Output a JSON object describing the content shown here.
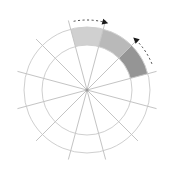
{
  "diagram": {
    "type": "polar-sector-grid",
    "center": {
      "x": 87,
      "y": 90
    },
    "inner_radius": 45,
    "outer_radius": 63,
    "spoke_radius": 72,
    "spoke_count": 12,
    "spoke_offset_deg": 15,
    "colors": {
      "ring": "#cfcfcf",
      "spoke": "#c4c4c4",
      "arrow": "#444444",
      "arrow_head": "#1a1a1a",
      "hub": "#9a9a9a"
    },
    "sectors": [
      {
        "name": "light-sector",
        "start_deg": 75,
        "end_deg": 105,
        "color": "#d0d0d0"
      },
      {
        "name": "medium-sector",
        "start_deg": 45,
        "end_deg": 75,
        "color": "#b9b9b9"
      },
      {
        "name": "dark-sector",
        "start_deg": 15,
        "end_deg": 45,
        "color": "#959595"
      }
    ],
    "arrows": [
      {
        "name": "clockwise-arrow",
        "radius": 70,
        "from_deg": 101,
        "to_deg": 74,
        "direction": "clockwise"
      },
      {
        "name": "counterclockwise-arrow",
        "radius": 70,
        "from_deg": 22,
        "to_deg": 47,
        "direction": "counterclockwise"
      }
    ]
  }
}
